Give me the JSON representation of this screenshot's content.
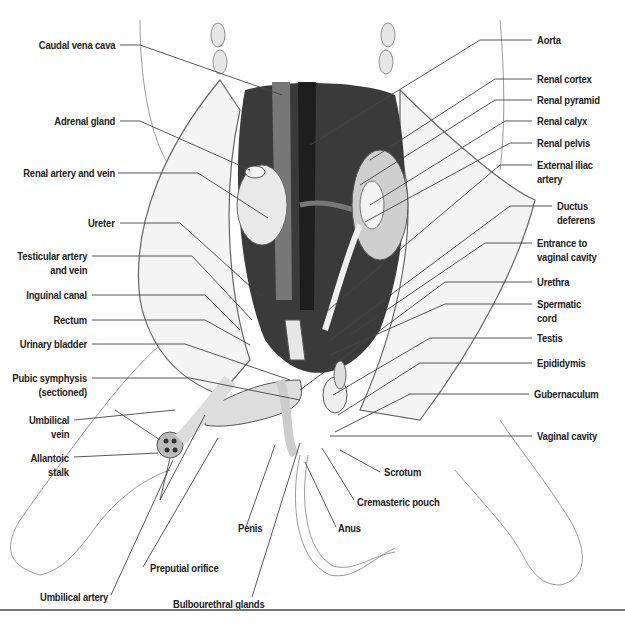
{
  "figure": {
    "colors": {
      "ink": "#222222",
      "leader": "#444444",
      "vessel_dark": "#2b2b2b",
      "vessel_mid": "#6a6a6a",
      "cavity": "#3a3a3a",
      "rule": "#777777"
    }
  },
  "labels_left": [
    {
      "id": "caudal-vena-cava",
      "text": "Caudal vena cava",
      "x": 115,
      "y": 38,
      "line": [
        [
          120,
          45
        ],
        [
          140,
          45
        ],
        [
          282,
          95
        ]
      ]
    },
    {
      "id": "adrenal-gland",
      "text": "Adrenal gland",
      "x": 115,
      "y": 114,
      "line": [
        [
          120,
          121
        ],
        [
          140,
          121
        ],
        [
          250,
          170
        ]
      ]
    },
    {
      "id": "renal-artery-and-vein",
      "text": "Renal artery and vein",
      "x": 115,
      "y": 166,
      "line": [
        [
          118,
          173
        ],
        [
          198,
          173
        ],
        [
          268,
          218
        ]
      ]
    },
    {
      "id": "ureter",
      "text": "Ureter",
      "x": 115,
      "y": 216,
      "line": [
        [
          120,
          223
        ],
        [
          180,
          223
        ],
        [
          262,
          297
        ]
      ]
    },
    {
      "id": "testicular-artery-and-vein",
      "text": "Testicular artery\nand vein",
      "x": 87,
      "y": 249,
      "line": [
        [
          92,
          256
        ],
        [
          192,
          256
        ],
        [
          252,
          320
        ]
      ]
    },
    {
      "id": "inguinal-canal",
      "text": "Inguinal canal",
      "x": 87,
      "y": 288,
      "line": [
        [
          92,
          295
        ],
        [
          205,
          295
        ],
        [
          240,
          330
        ]
      ]
    },
    {
      "id": "rectum",
      "text": "Rectum",
      "x": 87,
      "y": 313,
      "line": [
        [
          92,
          320
        ],
        [
          205,
          320
        ],
        [
          250,
          345
        ]
      ]
    },
    {
      "id": "urinary-bladder",
      "text": "Urinary bladder",
      "x": 87,
      "y": 337,
      "line": [
        [
          92,
          344
        ],
        [
          185,
          344
        ],
        [
          290,
          380
        ]
      ]
    },
    {
      "id": "pubic-symphysis",
      "text": "Pubic symphysis\n(sectioned)",
      "x": 87,
      "y": 371,
      "line": [
        [
          92,
          378
        ],
        [
          190,
          378
        ],
        [
          300,
          400
        ]
      ]
    },
    {
      "id": "umbilical-vein",
      "text": "Umbilical\nvein",
      "x": 69,
      "y": 413,
      "line": [
        [
          74,
          420
        ],
        [
          175,
          410
        ]
      ]
    },
    {
      "id": "allantoic-stalk",
      "text": "Allantoic\nstalk",
      "x": 69,
      "y": 451,
      "line": [
        [
          74,
          457
        ],
        [
          158,
          453
        ]
      ]
    }
  ],
  "labels_right": [
    {
      "id": "aorta",
      "text": "Aorta",
      "x": 537,
      "y": 33,
      "line": [
        [
          532,
          40
        ],
        [
          480,
          40
        ],
        [
          310,
          145
        ]
      ]
    },
    {
      "id": "renal-cortex",
      "text": "Renal cortex",
      "x": 537,
      "y": 72,
      "line": [
        [
          532,
          79
        ],
        [
          495,
          79
        ],
        [
          370,
          160
        ]
      ]
    },
    {
      "id": "renal-pyramid",
      "text": "Renal pyramid",
      "x": 537,
      "y": 93,
      "line": [
        [
          532,
          100
        ],
        [
          495,
          100
        ],
        [
          360,
          185
        ]
      ]
    },
    {
      "id": "renal-calyx",
      "text": "Renal calyx",
      "x": 537,
      "y": 114,
      "line": [
        [
          532,
          121
        ],
        [
          505,
          121
        ],
        [
          370,
          205
        ]
      ]
    },
    {
      "id": "renal-pelvis",
      "text": "Renal pelvis",
      "x": 537,
      "y": 136,
      "line": [
        [
          532,
          143
        ],
        [
          510,
          143
        ],
        [
          365,
          222
        ]
      ]
    },
    {
      "id": "external-iliac-artery",
      "text": "External iliac\nartery",
      "x": 537,
      "y": 158,
      "line": [
        [
          532,
          165
        ],
        [
          500,
          165
        ],
        [
          325,
          313
        ]
      ]
    },
    {
      "id": "ductus-deferens",
      "text": "Ductus\ndeferens",
      "x": 557,
      "y": 199,
      "line": [
        [
          552,
          206
        ],
        [
          510,
          206
        ],
        [
          330,
          340
        ]
      ]
    },
    {
      "id": "entrance-to-vaginal-cavity",
      "text": "Entrance to\nvaginal cavity",
      "x": 537,
      "y": 236,
      "line": [
        [
          532,
          243
        ],
        [
          485,
          243
        ],
        [
          350,
          335
        ]
      ]
    },
    {
      "id": "urethra",
      "text": "Urethra",
      "x": 537,
      "y": 275,
      "line": [
        [
          532,
          282
        ],
        [
          445,
          282
        ],
        [
          300,
          390
        ]
      ]
    },
    {
      "id": "spermatic-cord",
      "text": "Spermatic\ncord",
      "x": 537,
      "y": 297,
      "line": [
        [
          532,
          304
        ],
        [
          445,
          304
        ],
        [
          330,
          355
        ]
      ]
    },
    {
      "id": "testis",
      "text": "Testis",
      "x": 537,
      "y": 331,
      "line": [
        [
          532,
          338
        ],
        [
          430,
          338
        ],
        [
          333,
          395
        ]
      ]
    },
    {
      "id": "epididymis",
      "text": "Epididymis",
      "x": 537,
      "y": 356,
      "line": [
        [
          532,
          363
        ],
        [
          420,
          363
        ],
        [
          338,
          415
        ]
      ]
    },
    {
      "id": "gubernaculum",
      "text": "Gubernaculum",
      "x": 534,
      "y": 387,
      "line": [
        [
          529,
          394
        ],
        [
          410,
          394
        ],
        [
          335,
          432
        ]
      ]
    },
    {
      "id": "vaginal-cavity",
      "text": "Vaginal cavity",
      "x": 537,
      "y": 429,
      "line": [
        [
          532,
          436
        ],
        [
          330,
          436
        ]
      ]
    }
  ],
  "labels_bottom": [
    {
      "id": "scrotum",
      "text": "Scrotum",
      "x": 384,
      "y": 465,
      "line": [
        [
          380,
          472
        ],
        [
          340,
          450
        ]
      ]
    },
    {
      "id": "cremasteric-pouch",
      "text": "Cremasteric pouch",
      "x": 357,
      "y": 495,
      "line": [
        [
          354,
          500
        ],
        [
          322,
          448
        ]
      ]
    },
    {
      "id": "anus",
      "text": "Anus",
      "x": 338,
      "y": 521,
      "line": [
        [
          336,
          527
        ],
        [
          305,
          462
        ]
      ]
    },
    {
      "id": "penis",
      "text": "Penis",
      "x": 238,
      "y": 521,
      "line": [
        [
          246,
          527
        ],
        [
          275,
          445
        ]
      ]
    },
    {
      "id": "preputial-orifice",
      "text": "Preputial orifice",
      "x": 150,
      "y": 561,
      "line": [
        [
          143,
          567
        ],
        [
          218,
          438
        ]
      ]
    },
    {
      "id": "umbilical-artery",
      "text": "Umbilical artery",
      "x": 40,
      "y": 590,
      "line": [
        [
          111,
          595
        ],
        [
          173,
          460
        ]
      ]
    },
    {
      "id": "bulbourethral-glands",
      "text": "Bulbourethral glands",
      "x": 173,
      "y": 597,
      "line": [
        [
          252,
          597
        ],
        [
          300,
          443
        ]
      ]
    }
  ],
  "extra_leaders": [
    {
      "for": "umbilical-vein",
      "line": [
        [
          115,
          410
        ],
        [
          160,
          440
        ]
      ]
    },
    {
      "for": "umbilical-artery",
      "line": [
        [
          160,
          500
        ],
        [
          170,
          458
        ]
      ]
    },
    {
      "for": "umbilical-artery-2",
      "line": [
        [
          160,
          500
        ],
        [
          205,
          415
        ]
      ]
    }
  ]
}
